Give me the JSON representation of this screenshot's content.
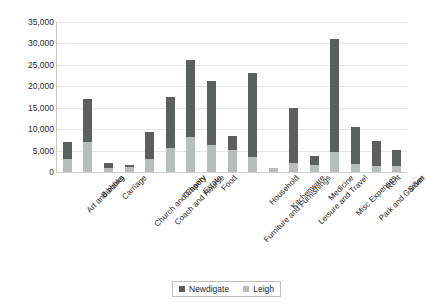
{
  "chart_data": {
    "type": "bar",
    "subtype": "stacked-column",
    "title": "",
    "xlabel": "",
    "ylabel": "",
    "ylim": [
      0,
      35000
    ],
    "ytick_interval": 5000,
    "ytick_labels": [
      "35,000",
      "30,000",
      "25,000",
      "20,000",
      "15,000",
      "10,000",
      "5,000",
      "0"
    ],
    "ytick_values": [
      35000,
      30000,
      25000,
      20000,
      15000,
      10000,
      5000,
      0
    ],
    "grid": true,
    "legend_position": "bottom",
    "categories": [
      "Art and books",
      "Building",
      "Carriage",
      "Church and Charity",
      "Coach and Hourse",
      "Drapery",
      "Estate",
      "Food",
      "Furniture and Furnishings",
      "Household",
      "Kitchenware",
      "Leisure and Travel",
      "Medicine",
      "Misc Expenses",
      "Park and Garden",
      "Rent",
      "Silver"
    ],
    "series": [
      {
        "name": "Leigh",
        "color": "#b7bcbd",
        "values": [
          3100,
          7000,
          1000,
          1100,
          3100,
          5500,
          8100,
          6400,
          5200,
          3600,
          1000,
          2000,
          1600,
          4600,
          1800,
          1400,
          1500
        ]
      },
      {
        "name": "Newdigate",
        "color": "#5b5f60",
        "values": [
          4000,
          10000,
          1000,
          600,
          6200,
          11900,
          18100,
          14800,
          3100,
          19400,
          0,
          12900,
          2100,
          26400,
          8800,
          5800,
          3600
        ]
      }
    ],
    "totals": [
      7100,
      17000,
      2000,
      1700,
      9300,
      17400,
      26200,
      21200,
      8300,
      23000,
      1000,
      14900,
      3700,
      31000,
      10600,
      7200,
      5100
    ],
    "legend": [
      {
        "label": "Newdigate",
        "color": "#5b5f60"
      },
      {
        "label": "Leigh",
        "color": "#b7bcbd"
      }
    ]
  }
}
